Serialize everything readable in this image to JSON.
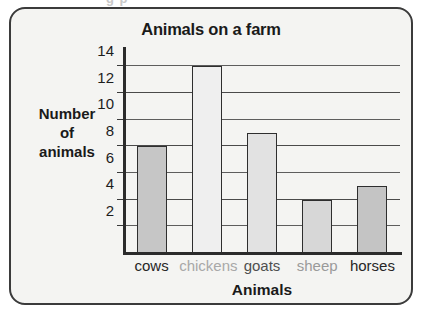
{
  "ghost_text_above": "g p",
  "chart_data": {
    "type": "bar",
    "title": "Animals on a farm",
    "xlabel": "Animals",
    "ylabel": "Number of animals",
    "ylabel_lines": [
      "Number",
      "of",
      "animals"
    ],
    "categories": [
      "cows",
      "chickens",
      "goats",
      "sheep",
      "horses"
    ],
    "values": [
      8,
      14,
      9,
      4,
      5
    ],
    "ylim": [
      0,
      15
    ],
    "yticks": [
      2,
      4,
      6,
      8,
      10,
      12,
      14
    ],
    "ytick_labels": [
      "2",
      "4",
      "6",
      "8",
      "10",
      "12",
      "14"
    ],
    "grid": true,
    "legend": "none",
    "bar_colors": [
      "#c6c6c6",
      "#efefef",
      "#e2e2e2",
      "#d7d7d7",
      "#c4c4c4"
    ],
    "bar_border_color": "#2e2e2e",
    "category_label_colors": [
      "#262626",
      "#a8a8a8",
      "#4f4f4f",
      "#9a9a9a",
      "#262626"
    ],
    "bars": [
      {
        "category": "cows",
        "value": 8,
        "label": "cows"
      },
      {
        "category": "chickens",
        "value": 14,
        "label": "chickens"
      },
      {
        "category": "goats",
        "value": 9,
        "label": "goats"
      },
      {
        "category": "sheep",
        "value": 4,
        "label": "sheep"
      },
      {
        "category": "horses",
        "value": 5,
        "label": "horses"
      }
    ]
  },
  "style": {
    "card_background": "#f4f4f2",
    "card_border": "#3b3b3b",
    "axis_color": "#2b2b2b",
    "gridline_color": "#5d5d5d",
    "title_color": "#1a1a1a"
  }
}
